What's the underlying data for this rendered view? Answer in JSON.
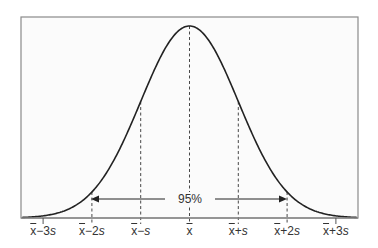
{
  "chart_data": {
    "type": "line",
    "title": "",
    "xlabel": "",
    "ylabel": "",
    "tick_labels": [
      {
        "base": "x",
        "suffix": "−3s",
        "offset_sd": -3
      },
      {
        "base": "x",
        "suffix": "−2s",
        "offset_sd": -2
      },
      {
        "base": "x",
        "suffix": "−s",
        "offset_sd": -1
      },
      {
        "base": "x",
        "suffix": "",
        "offset_sd": 0
      },
      {
        "base": "x",
        "suffix": "+s",
        "offset_sd": 1
      },
      {
        "base": "x",
        "suffix": "+2s",
        "offset_sd": 2
      },
      {
        "base": "x",
        "suffix": "+3s",
        "offset_sd": 3
      }
    ],
    "x_range_sd": [
      -3.5,
      3.5
    ],
    "dashed_lines_sd": [
      -2,
      -1,
      0,
      1,
      2
    ],
    "annotation": {
      "text": "95%",
      "from_sd": -2,
      "to_sd": 2
    },
    "grid": false,
    "legend": null,
    "curve_color": "#222222",
    "frame_color": "#888888",
    "background_color": "#fbfbfb"
  }
}
